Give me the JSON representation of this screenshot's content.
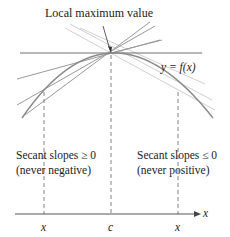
{
  "title": "Local maximum value",
  "curve_label": "y = f(x)",
  "left_note": {
    "line1": "Secant slopes ≥ 0",
    "line2": "(never negative)"
  },
  "right_note": {
    "line1": "Secant slopes ≤ 0",
    "line2": "(never positive)"
  },
  "axis": {
    "variable": "x",
    "ticks": [
      "x",
      "c",
      "x"
    ]
  },
  "colors": {
    "curve": "#8a8a8a",
    "tangent": "#6e6e6e",
    "secant_dark": "#9a9a9a",
    "secant_light": "#cfcfcf",
    "text": "#222222"
  }
}
